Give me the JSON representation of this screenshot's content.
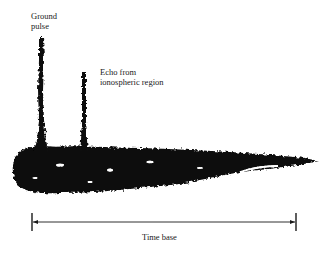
{
  "figure": {
    "type": "oscilloscope-trace-diagram",
    "labels": {
      "ground_pulse_line1": "Ground",
      "ground_pulse_line2": "pulse",
      "echo_line1": "Echo from",
      "echo_line2": "ionospheric region",
      "time_base": "Time base"
    },
    "elements": {
      "ground_pulse": {
        "x": 41,
        "top_y": 37,
        "base_y": 150
      },
      "echo_pulse": {
        "x": 84,
        "top_y": 72,
        "base_y": 150
      },
      "noise_band": {
        "left_x": 14,
        "right_x": 318,
        "center_y": 165
      },
      "time_base_arrow": {
        "left_x": 32,
        "right_x": 296,
        "y": 222
      }
    },
    "colors": {
      "ink": "#0a0a0a",
      "background": "#ffffff"
    }
  }
}
